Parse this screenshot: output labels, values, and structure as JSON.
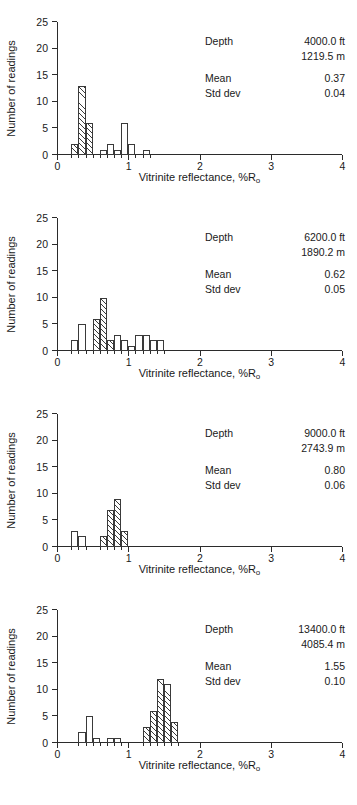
{
  "figure": {
    "axis_label_x": "Vitrinite reflectance, %R",
    "axis_label_x_sub": "o",
    "axis_label_y": "Number of readings",
    "y_ticks": [
      "0",
      "5",
      "10",
      "15",
      "20",
      "25"
    ],
    "x_ticks": [
      "0",
      "1",
      "2",
      "3",
      "4"
    ],
    "labels": {
      "depth": "Depth",
      "mean": "Mean",
      "std_dev": "Std dev"
    }
  },
  "chart_data": [
    {
      "type": "bar",
      "title": "Vitrinite reflectance histogram at 4000.0 ft",
      "xlabel": "Vitrinite reflectance, %Ro",
      "ylabel": "Number of readings",
      "xlim": [
        0,
        4
      ],
      "ylim": [
        0,
        25
      ],
      "yticks": [
        0,
        5,
        10,
        15,
        20,
        25
      ],
      "xticks": [
        0,
        1,
        2,
        3,
        4
      ],
      "grid": false,
      "legend": null,
      "bin_width": 0.1,
      "depth_ft": "4000.0 ft",
      "depth_m": "1219.5 m",
      "mean": "0.37",
      "std_dev": "0.04",
      "bins": [
        {
          "x0": 0.2,
          "x1": 0.3,
          "value": 2,
          "hatched": true
        },
        {
          "x0": 0.3,
          "x1": 0.4,
          "value": 13,
          "hatched": true
        },
        {
          "x0": 0.4,
          "x1": 0.5,
          "value": 6,
          "hatched": true
        },
        {
          "x0": 0.6,
          "x1": 0.7,
          "value": 1,
          "hatched": false
        },
        {
          "x0": 0.7,
          "x1": 0.8,
          "value": 2,
          "hatched": false
        },
        {
          "x0": 0.8,
          "x1": 0.9,
          "value": 1,
          "hatched": false
        },
        {
          "x0": 0.9,
          "x1": 1.0,
          "value": 6,
          "hatched": false
        },
        {
          "x0": 1.0,
          "x1": 1.1,
          "value": 2,
          "hatched": false
        },
        {
          "x0": 1.2,
          "x1": 1.3,
          "value": 1,
          "hatched": false
        }
      ]
    },
    {
      "type": "bar",
      "title": "Vitrinite reflectance histogram at 6200.0 ft",
      "xlabel": "Vitrinite reflectance, %Ro",
      "ylabel": "Number of readings",
      "xlim": [
        0,
        4
      ],
      "ylim": [
        0,
        25
      ],
      "yticks": [
        0,
        5,
        10,
        15,
        20,
        25
      ],
      "xticks": [
        0,
        1,
        2,
        3,
        4
      ],
      "grid": false,
      "legend": null,
      "bin_width": 0.1,
      "depth_ft": "6200.0 ft",
      "depth_m": "1890.2 m",
      "mean": "0.62",
      "std_dev": "0.05",
      "bins": [
        {
          "x0": 0.2,
          "x1": 0.3,
          "value": 2,
          "hatched": false
        },
        {
          "x0": 0.3,
          "x1": 0.4,
          "value": 5,
          "hatched": false
        },
        {
          "x0": 0.5,
          "x1": 0.6,
          "value": 6,
          "hatched": true
        },
        {
          "x0": 0.6,
          "x1": 0.7,
          "value": 10,
          "hatched": true
        },
        {
          "x0": 0.7,
          "x1": 0.8,
          "value": 2,
          "hatched": true
        },
        {
          "x0": 0.8,
          "x1": 0.9,
          "value": 3,
          "hatched": false
        },
        {
          "x0": 0.9,
          "x1": 1.0,
          "value": 2,
          "hatched": false
        },
        {
          "x0": 1.0,
          "x1": 1.1,
          "value": 1,
          "hatched": false
        },
        {
          "x0": 1.1,
          "x1": 1.2,
          "value": 3,
          "hatched": false
        },
        {
          "x0": 1.2,
          "x1": 1.3,
          "value": 3,
          "hatched": false
        },
        {
          "x0": 1.3,
          "x1": 1.4,
          "value": 2,
          "hatched": false
        },
        {
          "x0": 1.4,
          "x1": 1.5,
          "value": 2,
          "hatched": false
        }
      ]
    },
    {
      "type": "bar",
      "title": "Vitrinite reflectance histogram at 9000.0 ft",
      "xlabel": "Vitrinite reflectance, %Ro",
      "ylabel": "Number of readings",
      "xlim": [
        0,
        4
      ],
      "ylim": [
        0,
        25
      ],
      "yticks": [
        0,
        5,
        10,
        15,
        20,
        25
      ],
      "xticks": [
        0,
        1,
        2,
        3,
        4
      ],
      "grid": false,
      "legend": null,
      "bin_width": 0.1,
      "depth_ft": "9000.0 ft",
      "depth_m": "2743.9 m",
      "mean": "0.80",
      "std_dev": "0.06",
      "bins": [
        {
          "x0": 0.2,
          "x1": 0.3,
          "value": 3,
          "hatched": false
        },
        {
          "x0": 0.3,
          "x1": 0.4,
          "value": 2,
          "hatched": false
        },
        {
          "x0": 0.6,
          "x1": 0.7,
          "value": 2,
          "hatched": true
        },
        {
          "x0": 0.7,
          "x1": 0.8,
          "value": 7,
          "hatched": true
        },
        {
          "x0": 0.8,
          "x1": 0.9,
          "value": 9,
          "hatched": true
        },
        {
          "x0": 0.9,
          "x1": 1.0,
          "value": 3,
          "hatched": true
        }
      ]
    },
    {
      "type": "bar",
      "title": "Vitrinite reflectance histogram at 13400.0 ft",
      "xlabel": "Vitrinite reflectance, %Ro",
      "ylabel": "Number of readings",
      "xlim": [
        0,
        4
      ],
      "ylim": [
        0,
        25
      ],
      "yticks": [
        0,
        5,
        10,
        15,
        20,
        25
      ],
      "xticks": [
        0,
        1,
        2,
        3,
        4
      ],
      "grid": false,
      "legend": null,
      "bin_width": 0.1,
      "depth_ft": "13400.0 ft",
      "depth_m": "4085.4 m",
      "mean": "1.55",
      "std_dev": "0.10",
      "bins": [
        {
          "x0": 0.3,
          "x1": 0.4,
          "value": 2,
          "hatched": false
        },
        {
          "x0": 0.4,
          "x1": 0.5,
          "value": 5,
          "hatched": false
        },
        {
          "x0": 0.5,
          "x1": 0.6,
          "value": 1,
          "hatched": false
        },
        {
          "x0": 0.7,
          "x1": 0.8,
          "value": 1,
          "hatched": false
        },
        {
          "x0": 0.8,
          "x1": 0.9,
          "value": 1,
          "hatched": false
        },
        {
          "x0": 1.2,
          "x1": 1.3,
          "value": 3,
          "hatched": true
        },
        {
          "x0": 1.3,
          "x1": 1.4,
          "value": 6,
          "hatched": true
        },
        {
          "x0": 1.4,
          "x1": 1.5,
          "value": 12,
          "hatched": true
        },
        {
          "x0": 1.5,
          "x1": 1.6,
          "value": 11,
          "hatched": true
        },
        {
          "x0": 1.6,
          "x1": 1.7,
          "value": 4,
          "hatched": true
        }
      ]
    }
  ]
}
